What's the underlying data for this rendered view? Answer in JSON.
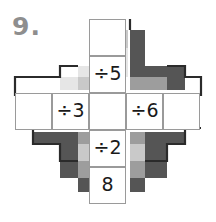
{
  "worksheet": {
    "question_number": "9.",
    "puzzle_type": "division-cross-puzzle",
    "grid": {
      "rows": 5,
      "cols": 5,
      "cell_size": 37,
      "origin_x": 15,
      "origin_y": 19
    },
    "cells": [
      {
        "id": "top",
        "row": 0,
        "col": 2,
        "value": "",
        "filled": false
      },
      {
        "id": "upper-middle",
        "row": 1,
        "col": 2,
        "value": "÷5",
        "filled": true
      },
      {
        "id": "left-outer",
        "row": 2,
        "col": 0,
        "value": "",
        "filled": false
      },
      {
        "id": "left-inner",
        "row": 2,
        "col": 1,
        "value": "÷3",
        "filled": true
      },
      {
        "id": "center",
        "row": 2,
        "col": 2,
        "value": "",
        "filled": false
      },
      {
        "id": "right-inner",
        "row": 2,
        "col": 3,
        "value": "÷6",
        "filled": true
      },
      {
        "id": "right-outer",
        "row": 2,
        "col": 4,
        "value": "",
        "filled": false
      },
      {
        "id": "lower-middle",
        "row": 3,
        "col": 2,
        "value": "÷2",
        "filled": true
      },
      {
        "id": "bottom",
        "row": 4,
        "col": 2,
        "value": "8",
        "filled": true
      }
    ],
    "colors": {
      "paper": "#ffffff",
      "cell_border": "#9a9a9a",
      "cell_text": "#1a1a1a",
      "question_number": "#8e8e8e",
      "deco_dark": "#555555",
      "deco_mid": "#9d9d9d",
      "deco_light": "#c9c9c9",
      "deco_pale": "#e6e6e6",
      "outline_dark": "#2b2b2b"
    },
    "decoration": {
      "shape": "stepped-diamond",
      "blocks": [
        {
          "x": 115,
          "y": 30,
          "w": 13,
          "h": 18,
          "color": "#c9c9c9"
        },
        {
          "x": 115,
          "y": 48,
          "w": 13,
          "h": 18,
          "color": "#e6e6e6"
        },
        {
          "x": 78,
          "y": 66,
          "w": 37,
          "h": 11,
          "color": "#e6e6e6"
        },
        {
          "x": 115,
          "y": 66,
          "w": 13,
          "h": 11,
          "color": "#e6e6e6"
        },
        {
          "x": 60,
          "y": 77,
          "w": 18,
          "h": 13,
          "color": "#e6e6e6"
        },
        {
          "x": 78,
          "y": 77,
          "w": 22,
          "h": 13,
          "color": "#c9c9c9"
        },
        {
          "x": 100,
          "y": 77,
          "w": 15,
          "h": 13,
          "color": "#e6e6e6"
        },
        {
          "x": 130,
          "y": 30,
          "w": 15,
          "h": 36,
          "color": "#555555"
        },
        {
          "x": 130,
          "y": 66,
          "w": 37,
          "h": 11,
          "color": "#555555"
        },
        {
          "x": 130,
          "y": 77,
          "w": 20,
          "h": 13,
          "color": "#9d9d9d"
        },
        {
          "x": 150,
          "y": 77,
          "w": 17,
          "h": 13,
          "color": "#9d9d9d"
        },
        {
          "x": 167,
          "y": 66,
          "w": 18,
          "h": 11,
          "color": "#555555"
        },
        {
          "x": 167,
          "y": 77,
          "w": 18,
          "h": 13,
          "color": "#555555"
        },
        {
          "x": 33,
          "y": 132,
          "w": 45,
          "h": 12,
          "color": "#555555"
        },
        {
          "x": 60,
          "y": 144,
          "w": 18,
          "h": 17,
          "color": "#555555"
        },
        {
          "x": 78,
          "y": 132,
          "w": 22,
          "h": 12,
          "color": "#9d9d9d"
        },
        {
          "x": 100,
          "y": 132,
          "w": 15,
          "h": 12,
          "color": "#c9c9c9"
        },
        {
          "x": 78,
          "y": 144,
          "w": 22,
          "h": 17,
          "color": "#c9c9c9"
        },
        {
          "x": 78,
          "y": 161,
          "w": 22,
          "h": 17,
          "color": "#9d9d9d"
        },
        {
          "x": 60,
          "y": 161,
          "w": 18,
          "h": 17,
          "color": "#555555"
        },
        {
          "x": 78,
          "y": 178,
          "w": 22,
          "h": 14,
          "color": "#555555"
        },
        {
          "x": 130,
          "y": 132,
          "w": 15,
          "h": 12,
          "color": "#9d9d9d"
        },
        {
          "x": 145,
          "y": 132,
          "w": 40,
          "h": 12,
          "color": "#555555"
        },
        {
          "x": 130,
          "y": 144,
          "w": 15,
          "h": 17,
          "color": "#c9c9c9"
        },
        {
          "x": 145,
          "y": 144,
          "w": 22,
          "h": 17,
          "color": "#555555"
        },
        {
          "x": 130,
          "y": 161,
          "w": 15,
          "h": 17,
          "color": "#9d9d9d"
        },
        {
          "x": 145,
          "y": 161,
          "w": 22,
          "h": 17,
          "color": "#555555"
        },
        {
          "x": 130,
          "y": 178,
          "w": 15,
          "h": 14,
          "color": "#555555"
        }
      ]
    }
  }
}
